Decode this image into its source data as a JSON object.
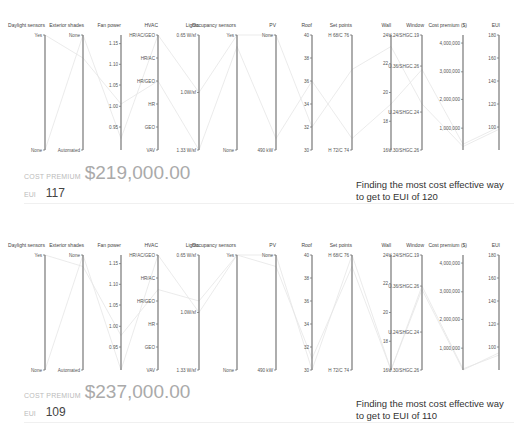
{
  "panels": [
    {
      "cost_premium_label": "COST PREMIUM",
      "cost_premium_value": "$219,000.00",
      "eui_label": "EUI",
      "eui_value": "117",
      "caption_line1": "Finding the most cost effective way",
      "caption_line2": "to get to EUI of 120"
    },
    {
      "cost_premium_label": "COST PREMIUM",
      "cost_premium_value": "$237,000.00",
      "eui_label": "EUI",
      "eui_value": "109",
      "caption_line1": "Finding the most cost effective way",
      "caption_line2": "to get to EUI of 110"
    }
  ],
  "chart_data": [
    {
      "type": "parallel-coordinates",
      "title": "Finding the most cost effective way to get to EUI of 120",
      "axes": [
        {
          "name": "Daylight sensors",
          "ticks": [
            "Yes",
            "None"
          ]
        },
        {
          "name": "Exterior shades",
          "ticks": [
            "None",
            "Automated"
          ]
        },
        {
          "name": "Fan power",
          "ticks": [
            "1.15",
            "1.10",
            "1.05",
            "1.00",
            "0.95"
          ]
        },
        {
          "name": "HVAC",
          "ticks": [
            "HR/AC/GEO",
            "HR/AC",
            "HR/GEO",
            "HR",
            "GEO",
            "VAV"
          ]
        },
        {
          "name": "Lights",
          "ticks": [
            "0.65 W/sf",
            "1.0W/sf",
            "1.33 W/sf"
          ]
        },
        {
          "name": "Occupancy sensors",
          "ticks": [
            "Yes",
            "None"
          ]
        },
        {
          "name": "PV",
          "ticks": [
            "None",
            "490 kW"
          ]
        },
        {
          "name": "Roof",
          "ticks": [
            "40",
            "38",
            "36",
            "34",
            "32",
            "30"
          ]
        },
        {
          "name": "Set points",
          "ticks": [
            "H 68/C 76",
            "H 72/C 74"
          ]
        },
        {
          "name": "Wall",
          "ticks": [
            "24",
            "22",
            "20",
            "18",
            "16"
          ]
        },
        {
          "name": "Window",
          "ticks": [
            "U.24/SHGC.19",
            "U.36/SHGC.26",
            "U.24/SHGC.24",
            "U.30/SHGC.26"
          ]
        },
        {
          "name": "Cost premium ($)",
          "ticks": [
            "4,000,000",
            "3,000,000",
            "2,000,000",
            "1,000,000"
          ]
        },
        {
          "name": "EUI",
          "ticks": [
            "180",
            "160",
            "140",
            "120",
            "100"
          ]
        }
      ],
      "selected": {
        "cost_premium": 219000,
        "eui": 117
      }
    },
    {
      "type": "parallel-coordinates",
      "title": "Finding the most cost effective way to get to EUI of 110",
      "axes": [
        {
          "name": "Daylight sensors",
          "ticks": [
            "Yes",
            "None"
          ]
        },
        {
          "name": "Exterior shades",
          "ticks": [
            "None",
            "Automated"
          ]
        },
        {
          "name": "Fan power",
          "ticks": [
            "1.15",
            "1.10",
            "1.05",
            "1.00",
            "0.95"
          ]
        },
        {
          "name": "HVAC",
          "ticks": [
            "HR/AC/GEO",
            "HR/AC",
            "HR/GEO",
            "HR",
            "GEO",
            "VAV"
          ]
        },
        {
          "name": "Lights",
          "ticks": [
            "0.65 W/sf",
            "1.0W/sf",
            "1.33 W/sf"
          ]
        },
        {
          "name": "Occupancy sensors",
          "ticks": [
            "Yes",
            "None"
          ]
        },
        {
          "name": "PV",
          "ticks": [
            "None",
            "490 kW"
          ]
        },
        {
          "name": "Roof",
          "ticks": [
            "40",
            "38",
            "36",
            "34",
            "32",
            "30"
          ]
        },
        {
          "name": "Set points",
          "ticks": [
            "H 68/C 76",
            "H 72/C 74"
          ]
        },
        {
          "name": "Wall",
          "ticks": [
            "24",
            "22",
            "20",
            "18",
            "16"
          ]
        },
        {
          "name": "Window",
          "ticks": [
            "U.24/SHGC.19",
            "U.36/SHGC.26",
            "U.24/SHGC.24",
            "U.30/SHGC.26"
          ]
        },
        {
          "name": "Cost premium ($)",
          "ticks": [
            "4,000,000",
            "3,000,000",
            "2,000,000",
            "1,000,000"
          ]
        },
        {
          "name": "EUI",
          "ticks": [
            "180",
            "160",
            "140",
            "120",
            "100"
          ]
        }
      ],
      "selected": {
        "cost_premium": 237000,
        "eui": 109
      }
    }
  ]
}
